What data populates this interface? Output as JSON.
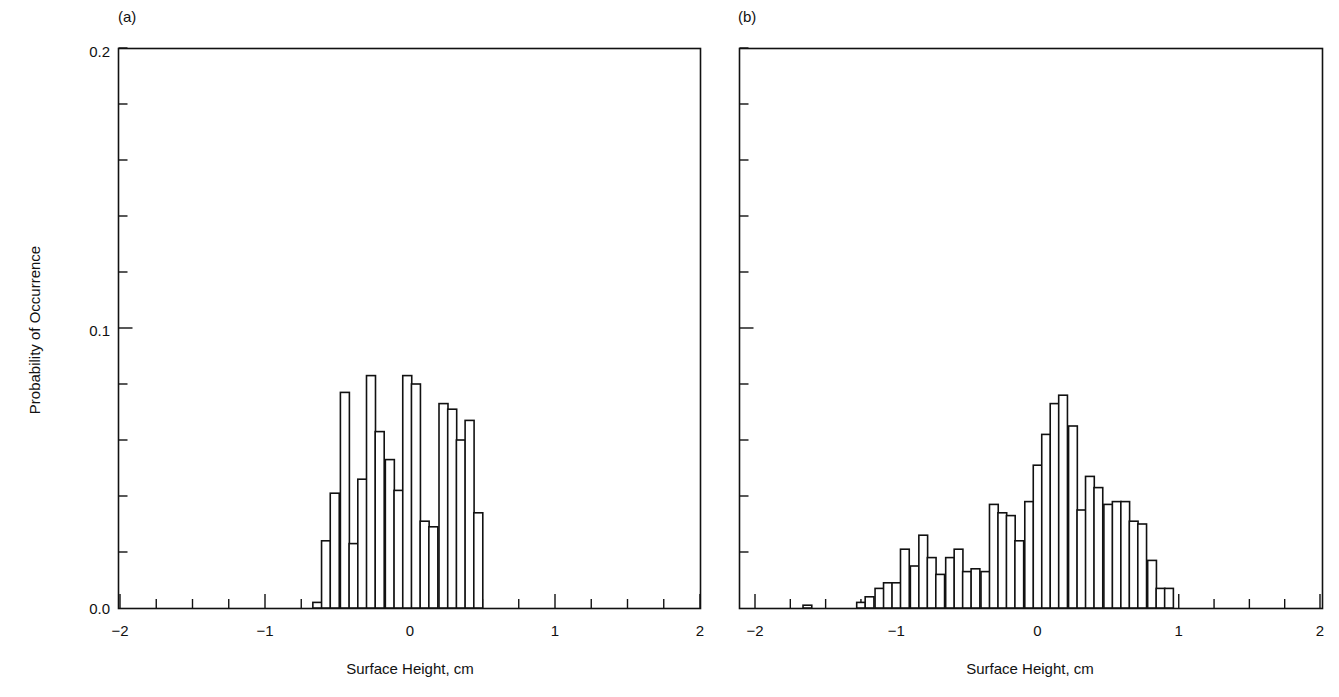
{
  "chart_data": [
    {
      "type": "bar",
      "panel_label": "(a)",
      "title": "",
      "xlabel": "Surface Height, cm",
      "ylabel": "Probability of Occurrence",
      "xlim": [
        -2,
        2
      ],
      "ylim": [
        0,
        0.2
      ],
      "x_ticks": [
        "−2",
        "−1",
        "0",
        "1",
        "2"
      ],
      "y_ticks": [
        "0.0",
        "0.1",
        "0.2"
      ],
      "grid": false,
      "bin_width": 0.062,
      "bin_starts": [
        -0.67,
        -0.61,
        -0.55,
        -0.48,
        -0.42,
        -0.36,
        -0.3,
        -0.24,
        -0.17,
        -0.11,
        -0.05,
        0.01,
        0.07,
        0.13,
        0.2,
        0.26,
        0.32,
        0.38,
        0.44,
        0.51
      ],
      "values": [
        0.002,
        0.024,
        0.041,
        0.077,
        0.023,
        0.046,
        0.083,
        0.063,
        0.053,
        0.042,
        0.083,
        0.08,
        0.031,
        0.029,
        0.073,
        0.071,
        0.06,
        0.067,
        0.034,
        0.0
      ]
    },
    {
      "type": "bar",
      "panel_label": "(b)",
      "title": "",
      "xlabel": "Surface Height, cm",
      "ylabel": "",
      "xlim": [
        -2,
        2
      ],
      "ylim": [
        0,
        0.2
      ],
      "x_ticks": [
        "−2",
        "−1",
        "0",
        "1",
        "2"
      ],
      "y_ticks": [],
      "grid": false,
      "bin_width": 0.062,
      "bin_starts": [
        -1.66,
        -1.28,
        -1.22,
        -1.15,
        -1.09,
        -1.03,
        -0.97,
        -0.9,
        -0.84,
        -0.78,
        -0.72,
        -0.65,
        -0.59,
        -0.53,
        -0.47,
        -0.4,
        -0.34,
        -0.28,
        -0.22,
        -0.16,
        -0.09,
        -0.03,
        0.03,
        0.09,
        0.15,
        0.22,
        0.28,
        0.34,
        0.4,
        0.47,
        0.53,
        0.59,
        0.65,
        0.71,
        0.78,
        0.84,
        0.9
      ],
      "values": [
        0.001,
        0.002,
        0.004,
        0.007,
        0.009,
        0.009,
        0.021,
        0.015,
        0.026,
        0.018,
        0.012,
        0.018,
        0.021,
        0.013,
        0.014,
        0.013,
        0.037,
        0.034,
        0.033,
        0.024,
        0.038,
        0.051,
        0.062,
        0.073,
        0.076,
        0.065,
        0.035,
        0.047,
        0.043,
        0.037,
        0.038,
        0.038,
        0.031,
        0.03,
        0.017,
        0.007,
        0.007
      ]
    }
  ],
  "figure": {
    "panel_a_label": "(a)",
    "panel_b_label": "(b)",
    "ylabel": "Probability of Occurrence",
    "xlabel_a": "Surface Height, cm",
    "xlabel_b": "Surface Height, cm",
    "ytick_00": "0.0",
    "ytick_01": "0.1",
    "ytick_02": "0.2",
    "xticks": [
      "−2",
      "−1",
      "0",
      "1",
      "2"
    ]
  }
}
